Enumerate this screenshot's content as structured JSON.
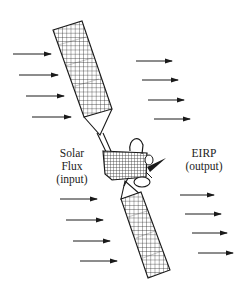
{
  "labels": {
    "input": {
      "line1": "Solar",
      "line2": "Flux",
      "line3": "(input)"
    },
    "output": {
      "line1": "EIRP",
      "line2": "(output)"
    }
  },
  "colors": {
    "stroke": "#1a1a1a",
    "background": "#ffffff"
  },
  "arrow_groups": {
    "upper_left_incoming": [
      {
        "x1": 13,
        "x2": 51,
        "y": 54
      },
      {
        "x1": 19,
        "x2": 58,
        "y": 75
      },
      {
        "x1": 26,
        "x2": 64,
        "y": 96
      },
      {
        "x1": 32,
        "x2": 71,
        "y": 117
      }
    ],
    "upper_right_outgoing": [
      {
        "x1": 136,
        "x2": 172,
        "y": 61
      },
      {
        "x1": 142,
        "x2": 178,
        "y": 80
      },
      {
        "x1": 148,
        "x2": 184,
        "y": 100
      },
      {
        "x1": 154,
        "x2": 190,
        "y": 119
      }
    ],
    "lower_left_incoming": [
      {
        "x1": 60,
        "x2": 97,
        "y": 199
      },
      {
        "x1": 66,
        "x2": 103,
        "y": 220
      },
      {
        "x1": 73,
        "x2": 110,
        "y": 241
      },
      {
        "x1": 80,
        "x2": 117,
        "y": 261
      }
    ],
    "lower_right_outgoing": [
      {
        "x1": 180,
        "x2": 214,
        "y": 195
      },
      {
        "x1": 185,
        "x2": 221,
        "y": 214
      },
      {
        "x1": 192,
        "x2": 227,
        "y": 233
      },
      {
        "x1": 198,
        "x2": 233,
        "y": 253
      }
    ]
  },
  "components": {
    "upper_solar_panel": "solar array (upper wing)",
    "lower_solar_panel": "solar array (lower wing)",
    "satellite_body": "spacecraft bus",
    "antenna": "dish antenna"
  }
}
